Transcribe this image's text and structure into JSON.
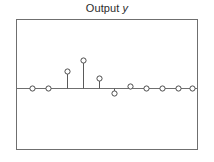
{
  "figure": {
    "width": 214,
    "height": 162,
    "background": "#ffffff"
  },
  "title": {
    "prefix": "Output ",
    "variable": "y",
    "full": "Output y",
    "color": "#2b2b2b"
  },
  "axes": {
    "frame_color": "#6f6f6f",
    "zero_line_color": "#6f6f6f",
    "x_tick_labels": [],
    "y_tick_labels": [],
    "grid": false,
    "box": true,
    "left_px": 16,
    "right_px": 198,
    "top_px": 19,
    "bottom_px": 150,
    "zero_px": 88
  },
  "style": {
    "stem_color": "#5a5a5a",
    "marker_edge_color": "#4d4d4d",
    "marker_face_color": "#ffffff",
    "marker_radius_px": 2.6
  },
  "chart_data": {
    "type": "line",
    "plot_style": "stem",
    "title": "Output y",
    "xlabel": "",
    "ylabel": "",
    "legend": [],
    "grid": false,
    "xlim": [
      -0.5,
      10.5
    ],
    "ylim": [
      -0.42,
      0.62
    ],
    "x": [
      0,
      1,
      2,
      3,
      4,
      5,
      6,
      7,
      8,
      9,
      10
    ],
    "values": [
      0,
      0,
      0.2,
      0.34,
      0.12,
      -0.06,
      0.015,
      0,
      0,
      0,
      0
    ],
    "annotations": []
  },
  "points_px": [
    {
      "index": 0,
      "x": 32,
      "y": 88
    },
    {
      "index": 1,
      "x": 48,
      "y": 88
    },
    {
      "index": 2,
      "x": 67,
      "y": 71
    },
    {
      "index": 3,
      "x": 83,
      "y": 60
    },
    {
      "index": 4,
      "x": 99,
      "y": 78
    },
    {
      "index": 5,
      "x": 114,
      "y": 93
    },
    {
      "index": 6,
      "x": 130,
      "y": 86
    },
    {
      "index": 7,
      "x": 146,
      "y": 88
    },
    {
      "index": 8,
      "x": 162,
      "y": 88
    },
    {
      "index": 9,
      "x": 178,
      "y": 88
    },
    {
      "index": 10,
      "x": 192,
      "y": 88
    }
  ]
}
